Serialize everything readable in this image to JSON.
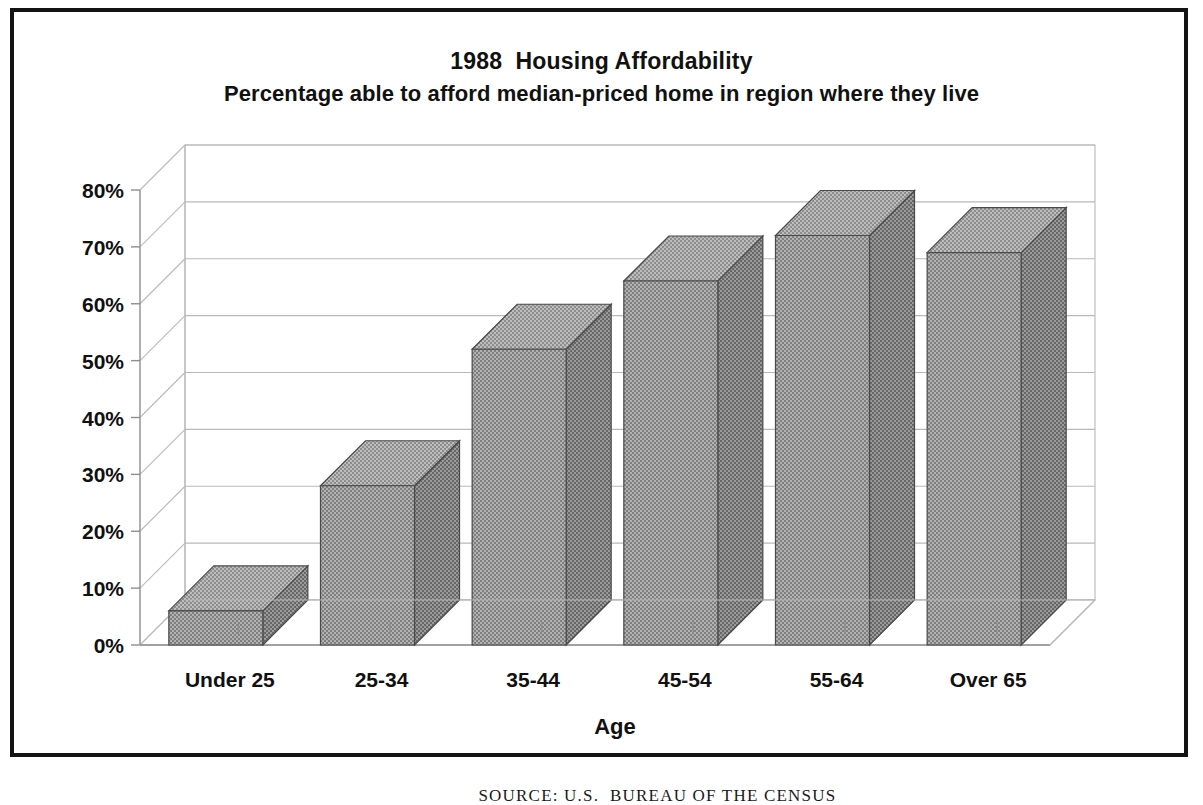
{
  "figure": {
    "title_line1": "1988  Housing Affordability",
    "title_line2": "Percentage able to afford median-priced home in region where they live",
    "source_note": "SOURCE: U.S.  BUREAU OF THE CENSUS",
    "frame_color": "#131313",
    "bar_face_color": "#999999",
    "bar_side_color": "#7e7e7e",
    "bar_top_color": "#a8a8a8",
    "bar_edge_color": "#4a4a4a",
    "grid_color": "#b9b9b9",
    "axis_color": "#8e8e8e"
  },
  "chart_data": {
    "type": "bar",
    "title": "1988  Housing Affordability",
    "subtitle": "Percentage able to afford median-priced home in region where they live",
    "xlabel": "Age",
    "ylabel": "",
    "categories": [
      "Under 25",
      "25-34",
      "35-44",
      "45-54",
      "55-64",
      "Over 65"
    ],
    "values": [
      6,
      28,
      52,
      64,
      72,
      69
    ],
    "ylim": [
      0,
      80
    ],
    "ytick_values": [
      0,
      10,
      20,
      30,
      40,
      50,
      60,
      70,
      80
    ],
    "ytick_labels": [
      "0%",
      "10%",
      "20%",
      "30%",
      "40%",
      "50%",
      "60%",
      "70%",
      "80%"
    ],
    "grid": true,
    "grid_axis": "y",
    "legend": false,
    "legend_position": "none",
    "projection": "3d-isometric",
    "value_format": "percent"
  }
}
